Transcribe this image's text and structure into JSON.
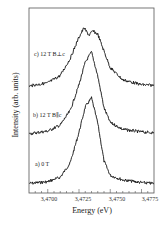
{
  "chart_data": {
    "type": "line",
    "title": "",
    "xlabel": "Energy (eV)",
    "ylabel": "Intensity (arb. units)",
    "xlim": [
      3.4685,
      3.4785
    ],
    "x_ticks": [
      "3,4700",
      "3,4725",
      "3,4750",
      "3,4775"
    ],
    "x_tick_values": [
      3.47,
      3.4725,
      3.475,
      3.4775
    ],
    "grid": false,
    "legend": "inline labels left of curves",
    "series": [
      {
        "name": "a) 0 T",
        "description": "single peak, vertically offset lowest",
        "x": [
          3.4685,
          3.47,
          3.471,
          3.4718,
          3.4725,
          3.473,
          3.4735,
          3.474,
          3.4745,
          3.475,
          3.476,
          3.4775,
          3.4785
        ],
        "y": [
          0.05,
          0.07,
          0.12,
          0.28,
          0.62,
          0.9,
          1.0,
          0.72,
          0.3,
          0.14,
          0.09,
          0.06,
          0.05
        ]
      },
      {
        "name": "b) 12 T B∥c",
        "description": "single peak, middle offset",
        "x": [
          3.4685,
          3.47,
          3.471,
          3.4718,
          3.4725,
          3.473,
          3.4735,
          3.474,
          3.4745,
          3.475,
          3.476,
          3.4775,
          3.4785
        ],
        "y": [
          0.05,
          0.08,
          0.15,
          0.32,
          0.62,
          0.88,
          1.0,
          0.72,
          0.35,
          0.18,
          0.1,
          0.07,
          0.06
        ]
      },
      {
        "name": "c) 12 T B⊥c",
        "description": "broadened doublet peak, top offset",
        "x": [
          3.4685,
          3.47,
          3.471,
          3.4718,
          3.4725,
          3.4729,
          3.4733,
          3.4736,
          3.474,
          3.4745,
          3.475,
          3.476,
          3.4775,
          3.4785
        ],
        "y": [
          0.05,
          0.1,
          0.22,
          0.5,
          0.85,
          1.0,
          0.88,
          0.95,
          0.9,
          0.62,
          0.35,
          0.15,
          0.07,
          0.06
        ]
      }
    ]
  },
  "labels": {
    "curve_a": "a) 0 T",
    "curve_b": "b) 12 T  B∥c",
    "curve_c": "c) 12 T  B⊥c",
    "xlabel": "Energy (eV)",
    "ylabel": "Intensity (arb. units)",
    "ticks": [
      "3,4700",
      "3,4725",
      "3,4750",
      "3,4775"
    ]
  }
}
